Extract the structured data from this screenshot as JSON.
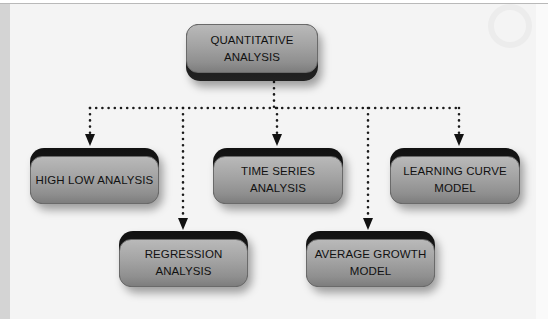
{
  "diagram": {
    "type": "hierarchy",
    "root": {
      "id": "quantitative-analysis",
      "lines": [
        "QUANTITATIVE",
        "ANALYSIS"
      ]
    },
    "children": [
      {
        "id": "high-low-analysis",
        "lines": [
          "HIGH LOW ANALYSIS"
        ]
      },
      {
        "id": "regression-analysis",
        "lines": [
          "REGRESSION",
          "ANALYSIS"
        ]
      },
      {
        "id": "time-series-analysis",
        "lines": [
          "TIME SERIES",
          "ANALYSIS"
        ]
      },
      {
        "id": "average-growth-model",
        "lines": [
          "AVERAGE GROWTH",
          "MODEL"
        ]
      },
      {
        "id": "learning-curve-model",
        "lines": [
          "LEARNING CURVE",
          "MODEL"
        ]
      }
    ],
    "edges": [
      {
        "from": "quantitative-analysis",
        "to": "high-low-analysis",
        "style": "dotted-arrow"
      },
      {
        "from": "quantitative-analysis",
        "to": "regression-analysis",
        "style": "dotted-arrow"
      },
      {
        "from": "quantitative-analysis",
        "to": "time-series-analysis",
        "style": "dotted-arrow"
      },
      {
        "from": "quantitative-analysis",
        "to": "average-growth-model",
        "style": "dotted-arrow"
      },
      {
        "from": "quantitative-analysis",
        "to": "learning-curve-model",
        "style": "dotted-arrow"
      }
    ],
    "colors": {
      "node_face": "#a3a3a3",
      "node_back": "#151515",
      "connector": "#1a1a1a",
      "background": "#f4f4f4"
    }
  }
}
